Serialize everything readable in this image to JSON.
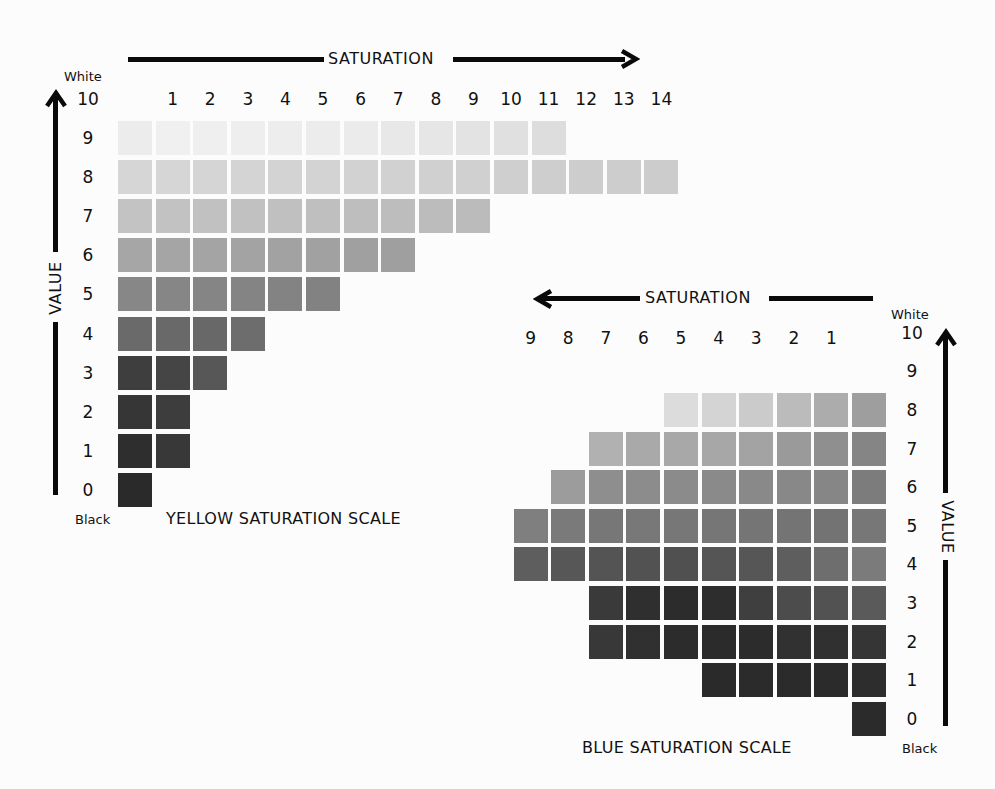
{
  "yellow": {
    "title": "YELLOW SATURATION SCALE",
    "saturation_label": "SATURATION",
    "value_label": "VALUE",
    "white_label": "White",
    "black_label": "Black",
    "saturation_ticks": [
      "1",
      "2",
      "3",
      "4",
      "5",
      "6",
      "7",
      "8",
      "9",
      "10",
      "11",
      "12",
      "13",
      "14"
    ],
    "value_ticks": [
      "10",
      "9",
      "8",
      "7",
      "6",
      "5",
      "4",
      "3",
      "2",
      "1",
      "0"
    ],
    "rows": [
      {
        "value": 9,
        "count": 12,
        "colors": [
          "#ececec",
          "#f0f0f0",
          "#efefef",
          "#eeeeee",
          "#ededed",
          "#ececec",
          "#ebebeb",
          "#e8e8e8",
          "#e6e6e6",
          "#e3e3e3",
          "#e0e0e0",
          "#dddddd"
        ]
      },
      {
        "value": 8,
        "count": 15,
        "colors": [
          "#d6d6d6",
          "#d6d6d6",
          "#d5d5d5",
          "#d4d4d4",
          "#d3d3d3",
          "#d3d3d3",
          "#d2d2d2",
          "#d1d1d1",
          "#d0d0d0",
          "#d0d0d0",
          "#cfcfcf",
          "#cecece",
          "#cdcdcd",
          "#cdcdcd",
          "#cccccc"
        ]
      },
      {
        "value": 7,
        "count": 10,
        "colors": [
          "#c3c3c3",
          "#c2c2c2",
          "#c1c1c1",
          "#c1c1c1",
          "#c0c0c0",
          "#bfbfbf",
          "#bebebe",
          "#bdbdbd",
          "#bcbcbc",
          "#bbbbbb"
        ]
      },
      {
        "value": 6,
        "count": 8,
        "colors": [
          "#a6a6a6",
          "#a5a5a5",
          "#a4a4a4",
          "#a3a3a3",
          "#a2a2a2",
          "#a1a1a1",
          "#a0a0a0",
          "#9f9f9f"
        ]
      },
      {
        "value": 5,
        "count": 6,
        "colors": [
          "#878787",
          "#868686",
          "#858585",
          "#848484",
          "#838383",
          "#828282"
        ]
      },
      {
        "value": 4,
        "count": 4,
        "colors": [
          "#6a6a6a",
          "#696969",
          "#686868",
          "#6d6d6d"
        ]
      },
      {
        "value": 3,
        "count": 3,
        "colors": [
          "#3e3e3e",
          "#454545",
          "#575757"
        ]
      },
      {
        "value": 2,
        "count": 2,
        "colors": [
          "#363636",
          "#3d3d3d"
        ]
      },
      {
        "value": 1,
        "count": 2,
        "colors": [
          "#2e2e2e",
          "#383838"
        ]
      },
      {
        "value": 0,
        "count": 1,
        "colors": [
          "#2a2a2a"
        ]
      }
    ]
  },
  "blue": {
    "title": "BLUE SATURATION SCALE",
    "saturation_label": "SATURATION",
    "value_label": "VALUE",
    "white_label": "White",
    "black_label": "Black",
    "saturation_ticks": [
      "9",
      "8",
      "7",
      "6",
      "5",
      "4",
      "3",
      "2",
      "1"
    ],
    "value_ticks": [
      "10",
      "9",
      "8",
      "7",
      "6",
      "5",
      "4",
      "3",
      "2",
      "1",
      "0"
    ],
    "rows": [
      {
        "value": 8,
        "count": 6,
        "colors": [
          "#dcdcdc",
          "#d4d4d4",
          "#cbcbcb",
          "#bbbbbb",
          "#acacac",
          "#9e9e9e"
        ]
      },
      {
        "value": 7,
        "count": 8,
        "colors": [
          "#b1b1b1",
          "#a9a9a9",
          "#a8a8a8",
          "#a7a7a7",
          "#a3a3a3",
          "#9a9a9a",
          "#8f8f8f",
          "#858585"
        ]
      },
      {
        "value": 6,
        "count": 9,
        "colors": [
          "#9c9c9c",
          "#8e8e8e",
          "#8c8c8c",
          "#8b8b8b",
          "#8a8a8a",
          "#898989",
          "#888888",
          "#868686",
          "#7c7c7c"
        ]
      },
      {
        "value": 5,
        "count": 10,
        "colors": [
          "#7f7f7f",
          "#7a7a7a",
          "#777777",
          "#787878",
          "#777777",
          "#767676",
          "#757575",
          "#747474",
          "#737373",
          "#777777"
        ]
      },
      {
        "value": 4,
        "count": 10,
        "colors": [
          "#5e5e5e",
          "#575757",
          "#545454",
          "#525252",
          "#505050",
          "#555555",
          "#565656",
          "#5e5e5e",
          "#6e6e6e",
          "#7b7b7b"
        ]
      },
      {
        "value": 3,
        "count": 8,
        "colors": [
          "#3a3a3a",
          "#2f2f2f",
          "#2c2c2c",
          "#2d2d2d",
          "#3f3f3f",
          "#4c4c4c",
          "#525252",
          "#5a5a5a"
        ]
      },
      {
        "value": 2,
        "count": 8,
        "colors": [
          "#383838",
          "#303030",
          "#2c2c2c",
          "#2b2b2b",
          "#2c2c2c",
          "#313131",
          "#303030",
          "#353535"
        ]
      },
      {
        "value": 1,
        "count": 5,
        "colors": [
          "#2a2a2a",
          "#2b2b2b",
          "#2b2b2b",
          "#2b2b2b",
          "#2d2d2d"
        ]
      },
      {
        "value": 0,
        "count": 1,
        "colors": [
          "#2b2b2b"
        ]
      }
    ]
  },
  "chart_data": [
    {
      "type": "heatmap",
      "title": "YELLOW SATURATION SCALE",
      "xlabel": "SATURATION",
      "ylabel": "VALUE",
      "x": [
        0,
        1,
        2,
        3,
        4,
        5,
        6,
        7,
        8,
        9,
        10,
        11,
        12,
        13,
        14
      ],
      "y": [
        0,
        1,
        2,
        3,
        4,
        5,
        6,
        7,
        8,
        9,
        10
      ],
      "y_endpoints": {
        "10": "White",
        "0": "Black"
      },
      "max_saturation_by_value": {
        "9": 11,
        "8": 14,
        "7": 9,
        "6": 7,
        "5": 5,
        "4": 3,
        "3": 2,
        "2": 1,
        "1": 1,
        "0": 0
      }
    },
    {
      "type": "heatmap",
      "title": "BLUE SATURATION SCALE",
      "xlabel": "SATURATION",
      "ylabel": "VALUE",
      "x": [
        9,
        8,
        7,
        6,
        5,
        4,
        3,
        2,
        1,
        0
      ],
      "y": [
        0,
        1,
        2,
        3,
        4,
        5,
        6,
        7,
        8,
        9,
        10
      ],
      "y_endpoints": {
        "10": "White",
        "0": "Black"
      },
      "max_saturation_by_value": {
        "8": 5,
        "7": 7,
        "6": 8,
        "5": 9,
        "4": 9,
        "3": 7,
        "2": 7,
        "1": 4,
        "0": 0
      }
    }
  ]
}
